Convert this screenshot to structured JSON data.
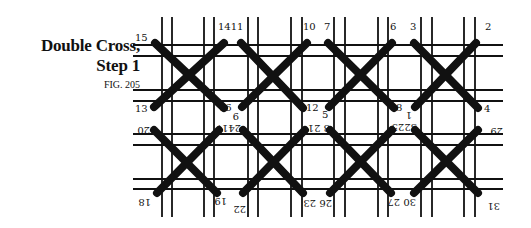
{
  "caption": {
    "title_line1": "Double Cross,",
    "title_line2": "Step 1",
    "figure": "FIG. 205"
  },
  "grid": {
    "vertical_lines_x": [
      162,
      172,
      204,
      214,
      248,
      258,
      291,
      302,
      334,
      345,
      378,
      388,
      421,
      432,
      464,
      475
    ],
    "horizontal_lines_y": [
      45,
      56,
      90,
      101,
      134,
      145,
      179,
      189
    ],
    "v_extent": [
      17,
      217
    ],
    "h_extent": [
      133,
      503
    ],
    "line_color": "#111111"
  },
  "stitch_color": "#111111",
  "stitches": [
    {
      "row": 1,
      "col": 1,
      "a": [
        155,
        43,
        224,
        108
      ],
      "b": [
        154,
        107,
        224,
        43
      ]
    },
    {
      "row": 1,
      "col": 2,
      "a": [
        241,
        43,
        303,
        108
      ],
      "b": [
        242,
        107,
        307,
        43
      ]
    },
    {
      "row": 1,
      "col": 3,
      "a": [
        328,
        43,
        394,
        108
      ],
      "b": [
        329,
        107,
        392,
        43
      ]
    },
    {
      "row": 1,
      "col": 4,
      "a": [
        414,
        43,
        478,
        108
      ],
      "b": [
        415,
        107,
        476,
        43
      ]
    },
    {
      "row": 2,
      "col": 1,
      "a": [
        154,
        130,
        217,
        193
      ],
      "b": [
        157,
        193,
        219,
        130
      ]
    },
    {
      "row": 2,
      "col": 2,
      "a": [
        243,
        130,
        303,
        193
      ],
      "b": [
        243,
        193,
        305,
        130
      ]
    },
    {
      "row": 2,
      "col": 3,
      "a": [
        330,
        130,
        391,
        193
      ],
      "b": [
        330,
        193,
        392,
        130
      ]
    },
    {
      "row": 2,
      "col": 4,
      "a": [
        415,
        130,
        478,
        193
      ],
      "b": [
        414,
        193,
        478,
        130
      ]
    }
  ],
  "labels_upright": [
    {
      "text": "15",
      "x": 135,
      "y": 41
    },
    {
      "text": "1411",
      "x": 218,
      "y": 30
    },
    {
      "text": "10",
      "x": 303,
      "y": 30
    },
    {
      "text": "7",
      "x": 324,
      "y": 30
    },
    {
      "text": "6",
      "x": 390,
      "y": 30
    },
    {
      "text": "3",
      "x": 410,
      "y": 30
    },
    {
      "text": "2",
      "x": 485,
      "y": 30
    },
    {
      "text": "13",
      "x": 135,
      "y": 112
    },
    {
      "text": "16",
      "x": 219,
      "y": 111
    },
    {
      "text": "12",
      "x": 306,
      "y": 111
    },
    {
      "text": "5",
      "x": 322,
      "y": 118
    },
    {
      "text": "8",
      "x": 396,
      "y": 111
    },
    {
      "text": "4",
      "x": 484,
      "y": 112
    }
  ],
  "labels_inverted": [
    {
      "text": "9",
      "x": 239,
      "y": 113
    },
    {
      "text": "1",
      "x": 412,
      "y": 112
    },
    {
      "text": "20",
      "x": 150,
      "y": 127
    },
    {
      "text": "2417",
      "x": 241,
      "y": 125
    },
    {
      "text": "8 21",
      "x": 330,
      "y": 125
    },
    {
      "text": "3225",
      "x": 417,
      "y": 124
    },
    {
      "text": "29",
      "x": 503,
      "y": 128
    },
    {
      "text": "18",
      "x": 151,
      "y": 199
    },
    {
      "text": "19",
      "x": 227,
      "y": 198
    },
    {
      "text": "22",
      "x": 246,
      "y": 206
    },
    {
      "text": "26 23",
      "x": 332,
      "y": 200
    },
    {
      "text": "30 27",
      "x": 416,
      "y": 199
    },
    {
      "text": "31",
      "x": 500,
      "y": 203
    }
  ]
}
